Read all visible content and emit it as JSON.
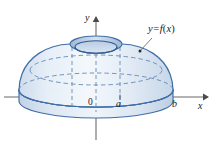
{
  "figure": {
    "background_color": "#ffffff",
    "labels": {
      "curve": {
        "lhs": "y",
        "operator": "=",
        "rhs_fn": "f",
        "rhs_arg": "x"
      },
      "curve_full": "y = f(x)",
      "y_axis": "y",
      "x_axis": "x",
      "origin": "0",
      "point_a": "a",
      "point_b": "b"
    },
    "colors": {
      "outline": "#3f6ea8",
      "outline_dark": "#2f5b93",
      "fill_light": "#eef3f9",
      "fill_mid": "#dce6f2",
      "fill_shadow": "#c3d3e6",
      "dashed": "#5f82b4",
      "axis": "#6b6b6b",
      "text": "#1a1a1a",
      "leader": "#4a4a4a"
    },
    "geometry": {
      "origin_px": {
        "x": 96,
        "y": 97
      },
      "x_axis_y_px": 97,
      "x_axis_extent_px": {
        "left": 4,
        "right": 206
      },
      "y_axis_extent_px": {
        "top": 16,
        "bottom": 140
      },
      "tick_a_x_px": 120,
      "tick_b_x_px": 176,
      "dome_apex_y_px": 44,
      "base_bottom_y_px": 112,
      "hole_center_px": {
        "x": 96,
        "y": 47
      },
      "hole_radius_px": {
        "rx": 22,
        "ry": 7
      }
    }
  }
}
